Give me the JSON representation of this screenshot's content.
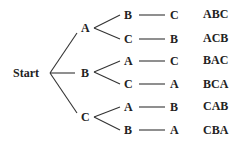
{
  "diagram": {
    "type": "permutation-tree",
    "root": "Start",
    "level1": [
      "A",
      "B",
      "C"
    ],
    "branches": [
      {
        "first": "A",
        "second": "B",
        "third": "C",
        "result": "ABC"
      },
      {
        "first": "A",
        "second": "C",
        "third": "B",
        "result": "ACB"
      },
      {
        "first": "B",
        "second": "A",
        "third": "C",
        "result": "BAC"
      },
      {
        "first": "B",
        "second": "C",
        "third": "A",
        "result": "BCA"
      },
      {
        "first": "C",
        "second": "A",
        "third": "B",
        "result": "CAB"
      },
      {
        "first": "C",
        "second": "B",
        "third": "A",
        "result": "CBA"
      }
    ],
    "line_color": "#333333",
    "text_color": "#222222"
  }
}
